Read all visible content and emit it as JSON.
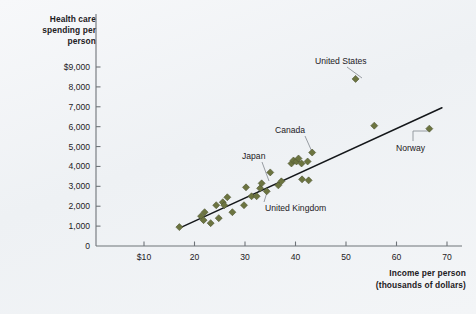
{
  "chart_data": {
    "type": "scatter",
    "title": "",
    "xlabel": "Income per person (thousands of dollars)",
    "ylabel": "Health care spending per person",
    "ylabel_lines": [
      "Health care",
      "spending per",
      "person"
    ],
    "xlabel_lines": [
      "Income per person",
      "(thousands of dollars)"
    ],
    "xlim": [
      0,
      72
    ],
    "ylim": [
      0,
      9500
    ],
    "grid": false,
    "legend": null,
    "xticks": [
      10,
      20,
      30,
      40,
      50,
      60,
      70
    ],
    "xtick_labels": [
      "$10",
      "20",
      "30",
      "40",
      "50",
      "60",
      "70"
    ],
    "yticks": [
      0,
      1000,
      2000,
      3000,
      4000,
      5000,
      6000,
      7000,
      8000,
      9000
    ],
    "ytick_labels": [
      "0",
      "1,000",
      "2,000",
      "3,000",
      "4,000",
      "5,000",
      "6,000",
      "7,000",
      "8,000",
      "$9,000"
    ],
    "marker_color": "#6c7440",
    "marker_shape": "diamond",
    "trend_line": {
      "color": "#14171a",
      "x_start": 17.0,
      "y_start": 900,
      "x_end": 69.0,
      "y_end": 6950
    },
    "points": [
      {
        "x": 17.0,
        "y": 950
      },
      {
        "x": 21.3,
        "y": 1500
      },
      {
        "x": 21.8,
        "y": 1300
      },
      {
        "x": 22.0,
        "y": 1700
      },
      {
        "x": 23.2,
        "y": 1150
      },
      {
        "x": 24.3,
        "y": 2050
      },
      {
        "x": 24.8,
        "y": 1400
      },
      {
        "x": 25.6,
        "y": 2200
      },
      {
        "x": 25.9,
        "y": 2050
      },
      {
        "x": 26.5,
        "y": 2450
      },
      {
        "x": 27.5,
        "y": 1700
      },
      {
        "x": 29.8,
        "y": 2050
      },
      {
        "x": 30.2,
        "y": 2950
      },
      {
        "x": 31.3,
        "y": 2500
      },
      {
        "x": 32.3,
        "y": 2500
      },
      {
        "x": 33.0,
        "y": 2900
      },
      {
        "x": 33.3,
        "y": 3150
      },
      {
        "x": 34.3,
        "y": 2750
      },
      {
        "x": 35.0,
        "y": 3700
      },
      {
        "x": 36.6,
        "y": 3050
      },
      {
        "x": 37.2,
        "y": 3250
      },
      {
        "x": 39.2,
        "y": 4150
      },
      {
        "x": 39.6,
        "y": 4300
      },
      {
        "x": 40.2,
        "y": 4250
      },
      {
        "x": 40.6,
        "y": 4400
      },
      {
        "x": 41.2,
        "y": 4150
      },
      {
        "x": 41.3,
        "y": 3350
      },
      {
        "x": 42.4,
        "y": 4250
      },
      {
        "x": 42.6,
        "y": 3300
      },
      {
        "x": 43.3,
        "y": 4700
      },
      {
        "x": 51.9,
        "y": 8400
      },
      {
        "x": 55.6,
        "y": 6050
      },
      {
        "x": 66.5,
        "y": 5900
      }
    ],
    "annotations": [
      {
        "label": "United States",
        "x": 51.9,
        "y": 8400,
        "label_x": 315,
        "label_y": 56,
        "leader": {
          "x1": 347,
          "y1": 67,
          "x2": 362,
          "y2": 78
        }
      },
      {
        "label": "Canada",
        "x": 40.6,
        "y": 4400,
        "label_x": 275,
        "label_y": 125,
        "leader": {
          "x1": 305,
          "y1": 136,
          "x2": 313,
          "y2": 154
        }
      },
      {
        "label": "Japan",
        "x": 33.3,
        "y": 3150,
        "label_x": 242,
        "label_y": 151,
        "leader": {
          "x1": 262,
          "y1": 162,
          "x2": 269,
          "y2": 181
        }
      },
      {
        "label": "United Kingdom",
        "x": 34.3,
        "y": 2750,
        "label_x": 265,
        "label_y": 203,
        "leader": {
          "x1": 264,
          "y1": 202,
          "x2": 268,
          "y2": 189
        }
      },
      {
        "label": "Norway",
        "x": 66.5,
        "y": 5900,
        "label_x": 396,
        "label_y": 143,
        "leader": {
          "x1": 413,
          "y1": 141,
          "x2": 413,
          "y2": 131,
          "x3": 428,
          "y3": 131
        }
      }
    ]
  }
}
